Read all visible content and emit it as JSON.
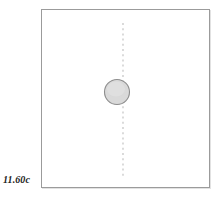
{
  "figure": {
    "label": "11.60c",
    "width": 221,
    "height": 197,
    "background_color": "#ffffff"
  },
  "panel": {
    "name": "diagram-panel",
    "border_color": "#9b9b9b",
    "fill_color": "#ffffff",
    "x": 41,
    "y": 9,
    "width": 169,
    "height": 179
  },
  "elements": {
    "centerline": {
      "name": "vertical-dashed-centerline",
      "color": "#bdbdbd",
      "orientation": "vertical",
      "x": 81,
      "y_start": 13,
      "y_end": 168,
      "dash": "2 3.2"
    },
    "node": {
      "name": "circle-node",
      "fill_color": "#d9d9d9",
      "stroke_color": "#8d8d8d",
      "center_x": 75,
      "center_y": 82,
      "radius": 12.5
    }
  }
}
